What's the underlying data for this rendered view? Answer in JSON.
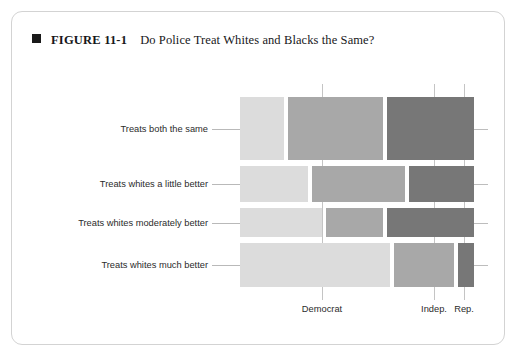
{
  "caption": {
    "bullet_icon": "filled-square-icon",
    "figure_number": "FIGURE 11-1",
    "title": "Do Police Treat Whites and Blacks the Same?"
  },
  "colors": {
    "democrat": "#dcdcdc",
    "independent": "#a8a8a8",
    "republican": "#777777",
    "card_border": "#d3d3d3",
    "gridline": "#b9b9b9",
    "text": "#2b2b2b"
  },
  "chart_data": {
    "type": "mosaic",
    "title": "Do Police Treat Whites and Blacks the Same?",
    "xlabel": "",
    "ylabel": "",
    "grid": false,
    "legend_position": "none",
    "columns": [
      "Democrat",
      "Indep.",
      "Rep."
    ],
    "x_tick_labels": [
      "Democrat",
      "Indep.",
      "Rep."
    ],
    "categories": [
      "Treats both the same",
      "Treats whites a little better",
      "Treats whites moderately better",
      "Treats whites much better"
    ],
    "row_heights_pct": [
      27.3,
      16.0,
      12.8,
      19.2
    ],
    "series": [
      {
        "name": "Democrat",
        "values": [
          18.8,
          29.3,
          35.0,
          64.1
        ]
      },
      {
        "name": "Indep.",
        "values": [
          40.6,
          28.8,
          24.4,
          25.6
        ]
      },
      {
        "name": "Rep.",
        "values": [
          40.6,
          41.9,
          40.6,
          10.3
        ]
      }
    ]
  },
  "layout": {
    "plot_left": 228,
    "plot_right": 462,
    "rows": [
      {
        "top": 85,
        "bottom": 148
      },
      {
        "top": 154,
        "bottom": 190
      },
      {
        "top": 196,
        "bottom": 225
      },
      {
        "top": 231,
        "bottom": 275
      }
    ],
    "row_tiles": [
      [
        {
          "x0": 228,
          "x1": 272
        },
        {
          "x0": 276,
          "x1": 371
        },
        {
          "x0": 375,
          "x1": 462
        }
      ],
      [
        {
          "x0": 228,
          "x1": 296
        },
        {
          "x0": 300,
          "x1": 393
        },
        {
          "x0": 397,
          "x1": 462
        }
      ],
      [
        {
          "x0": 228,
          "x1": 310
        },
        {
          "x0": 314,
          "x1": 371
        },
        {
          "x0": 375,
          "x1": 462
        }
      ],
      [
        {
          "x0": 228,
          "x1": 378
        },
        {
          "x0": 382,
          "x1": 442
        },
        {
          "x0": 446,
          "x1": 462
        }
      ]
    ],
    "x_tick_positions": [
      310,
      422,
      452
    ]
  }
}
